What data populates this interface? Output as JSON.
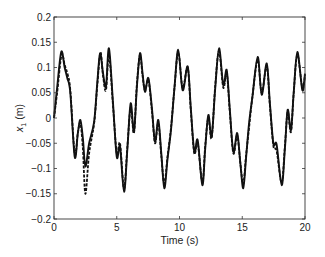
{
  "chart_data": {
    "type": "line",
    "title": "",
    "xlabel": "Time (s)",
    "ylabel": "x1 (m)",
    "ylabel_main": "x",
    "ylabel_sub": "1",
    "ylabel_unit": " (m)",
    "xlim": [
      0,
      20
    ],
    "ylim": [
      -0.2,
      0.2
    ],
    "xticks": [
      0,
      5,
      10,
      15,
      20
    ],
    "xtick_labels": [
      "0",
      "5",
      "10",
      "15",
      "20"
    ],
    "yticks": [
      -0.2,
      -0.15,
      -0.1,
      -0.05,
      0,
      0.05,
      0.1,
      0.15,
      0.2
    ],
    "ytick_labels": [
      "-0.2",
      "-0.15",
      "-0.1",
      "-0.05",
      "0",
      "0.05",
      "0.1",
      "0.15",
      "0.2"
    ],
    "grid": false,
    "legend": null,
    "series": [
      {
        "name": "solid",
        "style": "solid",
        "color": "#111111",
        "x": [
          0,
          0.25,
          0.58,
          0.85,
          1.06,
          1.3,
          1.65,
          1.9,
          2.1,
          2.3,
          2.5,
          2.8,
          3.2,
          3.45,
          3.67,
          3.9,
          4.14,
          4.38,
          4.7,
          5.0,
          5.26,
          5.58,
          5.85,
          6.11,
          6.37,
          6.6,
          6.85,
          7.05,
          7.25,
          7.52,
          7.8,
          8.05,
          8.31,
          8.55,
          8.79,
          9.05,
          9.32,
          9.6,
          9.9,
          10.25,
          10.65,
          10.9,
          11.18,
          11.45,
          11.82,
          12.05,
          12.3,
          12.56,
          12.85,
          13.15,
          13.49,
          13.76,
          14.0,
          14.29,
          14.6,
          14.85,
          15.08,
          15.3,
          15.54,
          15.8,
          16.23,
          16.55,
          16.95,
          17.2,
          17.48,
          17.74,
          18.14,
          18.4,
          18.62,
          18.88,
          19.1,
          19.39,
          19.79,
          20.0
        ],
        "y": [
          0.0,
          0.06,
          0.131,
          0.1,
          0.079,
          0.05,
          -0.077,
          -0.03,
          -0.004,
          -0.04,
          -0.096,
          -0.05,
          -0.007,
          0.07,
          0.128,
          0.09,
          0.062,
          0.138,
          0.03,
          -0.077,
          -0.057,
          -0.146,
          -0.06,
          0.029,
          -0.027,
          0.06,
          0.128,
          0.09,
          0.052,
          0.079,
          0.02,
          -0.047,
          -0.004,
          -0.07,
          -0.139,
          -0.08,
          -0.024,
          0.06,
          0.135,
          0.055,
          0.102,
          0.02,
          -0.067,
          -0.044,
          -0.133,
          -0.06,
          0.006,
          -0.037,
          0.06,
          0.138,
          0.065,
          0.095,
          0.02,
          -0.067,
          -0.03,
          -0.09,
          -0.139,
          -0.08,
          -0.011,
          0.04,
          0.121,
          0.046,
          0.108,
          0.03,
          -0.05,
          -0.053,
          -0.133,
          -0.06,
          0.016,
          -0.024,
          0.05,
          0.131,
          0.055,
          0.088
        ]
      },
      {
        "name": "dashed",
        "style": "dashed",
        "color": "#111111",
        "x": [
          0,
          0.25,
          0.6,
          0.85,
          1.1,
          1.3,
          1.65,
          1.9,
          2.1,
          2.3,
          2.5,
          2.8,
          3.2,
          3.45,
          3.7,
          3.9,
          4.14,
          4.38,
          4.7,
          5.0,
          5.26,
          5.58,
          5.85,
          6.11,
          6.37,
          6.6,
          6.85,
          7.05,
          7.25,
          7.52,
          7.8,
          8.05,
          8.31,
          8.55,
          8.79,
          9.05,
          9.32,
          9.6,
          9.9,
          10.25,
          10.65,
          10.9,
          11.18,
          11.45,
          11.82,
          12.05,
          12.3,
          12.56,
          12.85,
          13.15,
          13.49,
          13.76,
          14.0,
          14.29,
          14.6,
          14.85,
          15.08,
          15.3,
          15.54,
          15.8,
          16.23,
          16.55,
          16.95,
          17.2,
          17.48,
          17.74,
          18.14,
          18.4,
          18.62,
          18.88,
          19.1,
          19.39,
          19.79,
          20.0
        ],
        "y": [
          0.0,
          0.05,
          0.125,
          0.105,
          0.085,
          0.055,
          -0.07,
          -0.03,
          -0.01,
          -0.06,
          -0.15,
          -0.07,
          -0.01,
          0.065,
          0.13,
          0.085,
          0.055,
          0.125,
          0.025,
          -0.07,
          -0.05,
          -0.14,
          -0.055,
          0.02,
          -0.03,
          0.065,
          0.125,
          0.085,
          0.055,
          0.075,
          0.015,
          -0.05,
          -0.01,
          -0.075,
          -0.13,
          -0.075,
          -0.02,
          0.06,
          0.13,
          0.06,
          0.1,
          0.015,
          -0.07,
          -0.05,
          -0.128,
          -0.055,
          0.0,
          -0.04,
          0.065,
          0.132,
          0.06,
          0.09,
          0.015,
          -0.07,
          -0.035,
          -0.09,
          -0.13,
          -0.075,
          -0.02,
          0.04,
          0.115,
          0.05,
          0.103,
          0.025,
          -0.055,
          -0.065,
          -0.128,
          -0.055,
          0.012,
          -0.028,
          0.05,
          0.125,
          0.06,
          0.085
        ]
      }
    ]
  }
}
